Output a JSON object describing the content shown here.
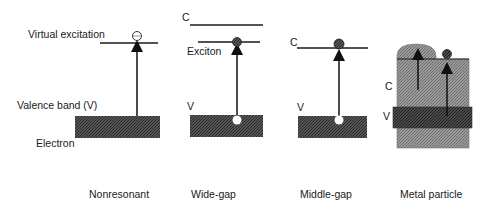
{
  "labels": {
    "virtual_excitation": "Virtual excitation",
    "valence_band": "Valence band (V)",
    "electron": "Electron",
    "exciton": "Exciton",
    "c": "C",
    "v": "V"
  },
  "panels": [
    {
      "id": "nonresonant",
      "caption_lines": [
        "Nonresonant",
        "nonlinearity"
      ]
    },
    {
      "id": "wide-gap",
      "caption_lines": [
        "Wide-gap",
        "semiconductor",
        "microcrystallite"
      ]
    },
    {
      "id": "middle-gap",
      "caption_lines": [
        "Middle-gap",
        "semiconductor",
        "microcrystallite"
      ]
    },
    {
      "id": "metal",
      "caption_lines": [
        "Metal particle"
      ]
    }
  ],
  "colors": {
    "band_fill": "#4a4a4a",
    "metal_conduction_fill": "#8c8c8c",
    "metal_valence_fill": "#3c3c3c",
    "line": "#1a1a1a"
  }
}
